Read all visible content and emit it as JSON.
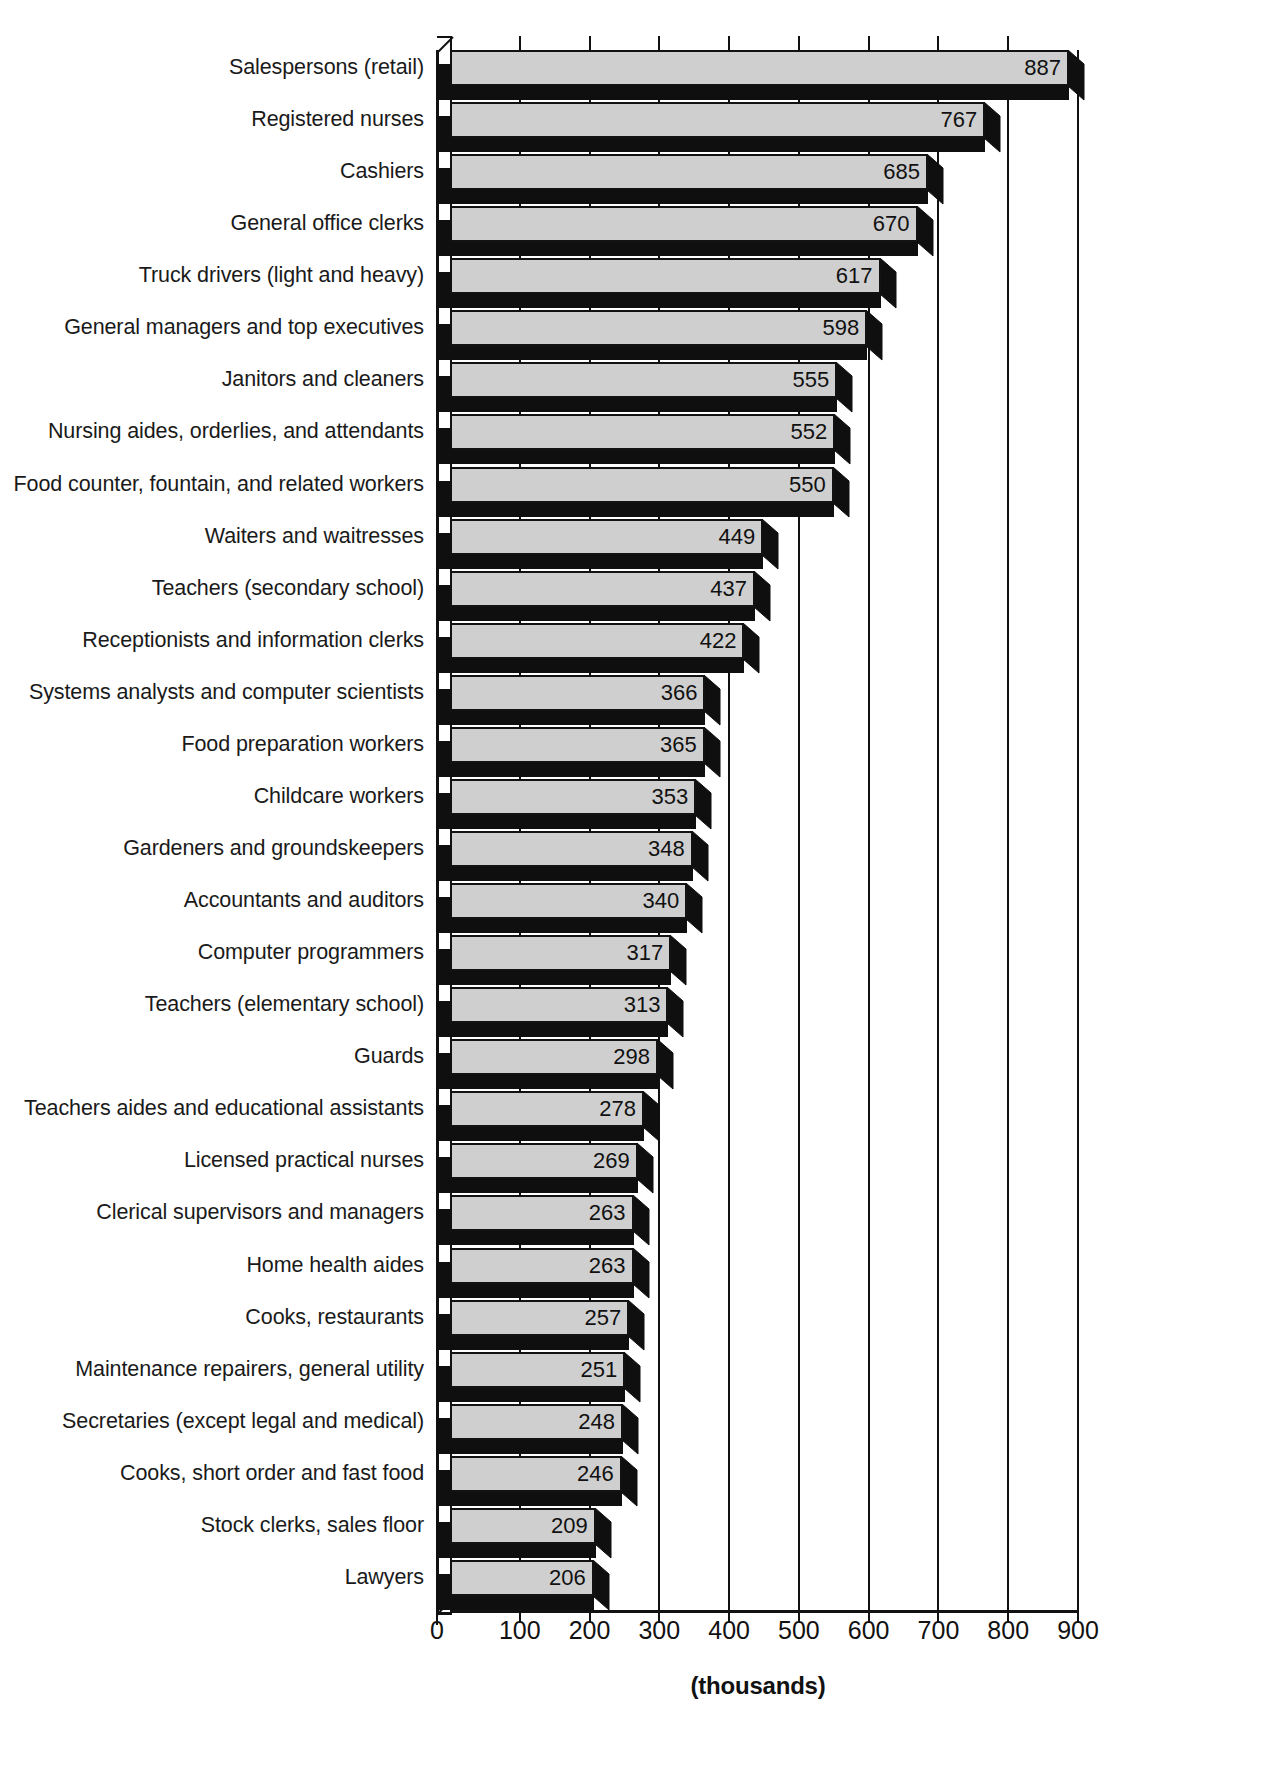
{
  "chart_data": {
    "type": "bar",
    "orientation": "horizontal",
    "title": "",
    "subtitle": "",
    "xlabel": "(thousands)",
    "ylabel": "",
    "xlim": [
      0,
      900
    ],
    "xticks": [
      0,
      100,
      200,
      300,
      400,
      500,
      600,
      700,
      800,
      900
    ],
    "xtick_labels": [
      "0",
      "100",
      "200",
      "300",
      "400",
      "500",
      "600",
      "700",
      "800",
      "900"
    ],
    "grid": true,
    "grid_axis": "x",
    "legend": null,
    "style": "3d-shadowed-bars",
    "value_labels_inside": true,
    "categories": [
      "Salespersons (retail)",
      "Registered nurses",
      "Cashiers",
      "General office clerks",
      "Truck drivers (light and heavy)",
      "General managers and top executives",
      "Janitors and cleaners",
      "Nursing aides, orderlies, and attendants",
      "Food counter, fountain, and related workers",
      "Waiters and waitresses",
      "Teachers (secondary school)",
      "Receptionists and information clerks",
      "Systems analysts and computer scientists",
      "Food preparation workers",
      "Childcare workers",
      "Gardeners and groundskeepers",
      "Accountants and auditors",
      "Computer programmers",
      "Teachers (elementary school)",
      "Guards",
      "Teachers aides and educational assistants",
      "Licensed practical nurses",
      "Clerical supervisors and managers",
      "Home health aides",
      "Cooks, restaurants",
      "Maintenance repairers, general utility",
      "Secretaries (except legal and medical)",
      "Cooks, short order and fast food",
      "Stock clerks, sales floor",
      "Lawyers"
    ],
    "values": [
      887,
      767,
      685,
      670,
      617,
      598,
      555,
      552,
      550,
      449,
      437,
      422,
      366,
      365,
      353,
      348,
      340,
      317,
      313,
      298,
      278,
      269,
      263,
      263,
      257,
      251,
      248,
      246,
      209,
      206
    ],
    "value_labels": [
      "887",
      "767",
      "685",
      "670",
      "617",
      "598",
      "555",
      "552",
      "550",
      "449",
      "437",
      "422",
      "366",
      "365",
      "353",
      "348",
      "340",
      "317",
      "313",
      "298",
      "278",
      "269",
      "263",
      "263",
      "257",
      "251",
      "248",
      "246",
      "209",
      "206"
    ]
  },
  "colors": {
    "bar_face": "#cfcfcf",
    "bar_shadow": "#100f0f",
    "axis": "#111111",
    "text": "#1a1a1a",
    "background": "#ffffff"
  }
}
